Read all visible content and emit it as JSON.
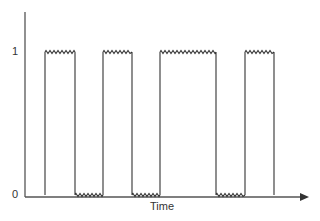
{
  "chart_data": {
    "type": "line",
    "title": "",
    "xlabel": "Time",
    "ylabel": "",
    "y_ticks": [
      "0",
      "1"
    ],
    "segments": [
      {
        "level": 0,
        "x_start": 25,
        "x_end": 45
      },
      {
        "level": 1,
        "x_start": 45,
        "x_end": 75
      },
      {
        "level": 0,
        "x_start": 75,
        "x_end": 103
      },
      {
        "level": 1,
        "x_start": 103,
        "x_end": 132
      },
      {
        "level": 0,
        "x_start": 132,
        "x_end": 160
      },
      {
        "level": 1,
        "x_start": 160,
        "x_end": 216
      },
      {
        "level": 0,
        "x_start": 216,
        "x_end": 245
      },
      {
        "level": 1,
        "x_start": 245,
        "x_end": 274
      },
      {
        "level": 0,
        "x_start": 274,
        "x_end": 300
      }
    ],
    "colors": {
      "line": "#333333",
      "axis": "#555555"
    }
  },
  "labels": {
    "y_one": "1",
    "y_zero": "0",
    "x_axis": "Time"
  }
}
